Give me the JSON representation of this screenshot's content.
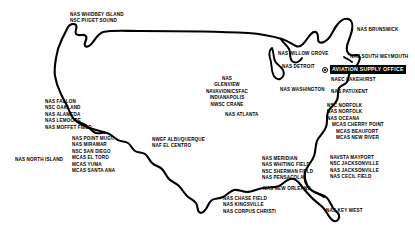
{
  "map": {
    "title": "U.S. Naval Aviation Shore Establishment Map",
    "region": "Continental United States",
    "ink_color": "#000000",
    "background_color": "#ffffff",
    "highlight_background": "#000000",
    "highlight_text_color": "#ffffff"
  },
  "highlight": {
    "label": "AVIATION SUPPLY OFFICE",
    "marker": "target-marker"
  },
  "labels": {
    "pacific_northwest": {
      "lines": [
        "NAS WHIDBEY ISLAND",
        "NSC PUGET SOUND"
      ]
    },
    "northern_california": {
      "lines": [
        "NAS FALLON",
        "NSC OAKLAND",
        "NAS ALAMEDA",
        "NAS LEMOORE",
        "NAS MOFFET FIELD"
      ]
    },
    "southern_california": {
      "lines": [
        "NAS POINT MUGU",
        "NAS MIRAMAR",
        "NSC SAN DIEGO",
        "MCAS EL TORO",
        "MCAS YUMA",
        "MCAS SANTA ANA"
      ]
    },
    "north_island": {
      "lines": [
        "NAS NORTH ISLAND"
      ]
    },
    "southwest": {
      "lines": [
        "NWEF ALBUQUERQUE",
        "NAF EL CENTRO"
      ]
    },
    "midwest": {
      "lines": [
        "NAS",
        "GLENVIEW",
        "NAVAVIONICSFAC",
        "INDIANAPOLIS",
        "NWSC CRANE"
      ]
    },
    "great_lakes": {
      "lines": [
        "NAS DETROIT"
      ]
    },
    "willow_grove": {
      "lines": [
        "NAS WILLOW GROVE"
      ]
    },
    "southeast_inland": {
      "lines": [
        "NAS ATLANTA"
      ]
    },
    "gulf_coast": {
      "lines": [
        "NAS MERIDIAN",
        "NAS WHITING FIELD",
        "NSC SHERMAN FIELD",
        "NAS PENSACOLA"
      ]
    },
    "new_orleans": {
      "lines": [
        "NAS NEW ORLEANS"
      ]
    },
    "texas": {
      "lines": [
        "NAS CHASE FIELD",
        "NAS KINGSVILLE",
        "NAS CORPUS CHRISTI"
      ]
    },
    "florida_keys": {
      "lines": [
        "NAS KEY WEST"
      ]
    },
    "florida_east": {
      "lines": [
        "NAVSTA MAYPORT",
        "NSC JACKSONVILLE",
        "NAS JACKSONVILLE",
        "NAS CECIL FIELD"
      ]
    },
    "mid_atlantic": {
      "lines": [
        "NSC NORFOLK",
        "NAS NORFOLK",
        "NAS OCEANA",
        "MCAS CHERRY POINT",
        "MCAS BEAUFORT",
        "MCAS NEW RIVER"
      ]
    },
    "patuxent": {
      "lines": [
        "NAS PATUXENT"
      ]
    },
    "washington": {
      "lines": [
        "NAS WASHINGTON"
      ]
    },
    "lakehurst": {
      "lines": [
        "NAEC LAKEHURST"
      ]
    },
    "new_england": {
      "lines": [
        "NAS BRUNSWICK"
      ]
    },
    "south_weymouth": {
      "lines": [
        "NAS SOUTH WEYMOUTH"
      ]
    }
  }
}
